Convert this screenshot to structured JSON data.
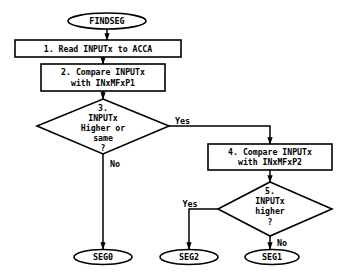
{
  "diagram": {
    "type": "flowchart",
    "title": "FINDSEG",
    "background_color": "#ffffff",
    "line_color": "#000000",
    "text_color": "#000000",
    "nodes": {
      "start": {
        "shape": "terminator",
        "label": "FINDSEG"
      },
      "step1": {
        "shape": "process",
        "label": "1.  Read INPUTx to ACCA"
      },
      "step2": {
        "shape": "process",
        "line1": "2.  Compare INPUTx",
        "line2": "with INxMFxP1"
      },
      "decision3": {
        "shape": "decision",
        "line1": "3.",
        "line2": "INPUTx",
        "line3": "Higher or",
        "line4": "same",
        "line5": "?"
      },
      "step4": {
        "shape": "process",
        "line1": "4.  Compare INPUTx",
        "line2": "with INxMFxP2"
      },
      "decision5": {
        "shape": "decision",
        "line1": "5.",
        "line2": "INPUTx",
        "line3": "higher",
        "line4": "?"
      },
      "end_seg0": {
        "shape": "terminator",
        "label": "SEG0"
      },
      "end_seg2": {
        "shape": "terminator",
        "label": "SEG2"
      },
      "end_seg1": {
        "shape": "terminator",
        "label": "SEG1"
      }
    },
    "edge_labels": {
      "d3_yes": "Yes",
      "d3_no": "No",
      "d5_yes": "Yes",
      "d5_no": "No"
    }
  }
}
